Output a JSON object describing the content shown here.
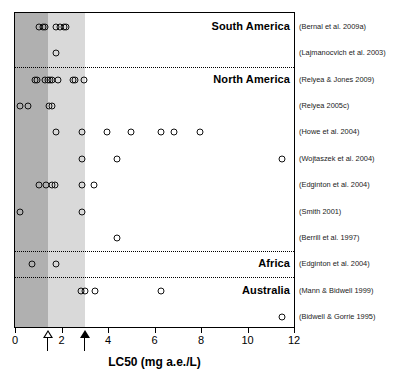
{
  "chart_data": {
    "type": "scatter",
    "title": "",
    "xlabel": "LC50 (mg a.e./L)",
    "ylabel": "",
    "xlim": [
      0,
      12
    ],
    "xticks": [
      0,
      2,
      4,
      6,
      8,
      10,
      12
    ],
    "xticklabels": [
      "0",
      "2",
      "4",
      "6",
      "8",
      "10",
      "12"
    ],
    "grid": false,
    "legend": null,
    "shaded_bands": [
      {
        "name": "dark-band",
        "from": 0,
        "to": 1.4,
        "color": "#b0b0b0"
      },
      {
        "name": "light-band",
        "from": 1.4,
        "to": 3.0,
        "color": "#d9d9d9"
      }
    ],
    "annotations": [
      {
        "name": "open-arrow",
        "x": 1.4,
        "style": "open-triangle"
      },
      {
        "name": "filled-arrow",
        "x": 3.0,
        "style": "filled-triangle"
      }
    ],
    "group_labels": [
      "South America",
      "North America",
      "Africa",
      "Australia"
    ],
    "series": [
      {
        "name": "(Bernal et al. 2009a)",
        "group": "South America",
        "values": [
          1.05,
          1.2,
          1.3,
          1.75,
          1.95,
          2.1,
          2.2
        ]
      },
      {
        "name": "(Lajmanocvich et al. 2003)",
        "group": "South America",
        "values": [
          1.75
        ]
      },
      {
        "name": "(Relyea & Jones 2009)",
        "group": "North America",
        "values": [
          0.85,
          0.95,
          1.3,
          1.4,
          1.5,
          1.6,
          1.85,
          2.5,
          2.6,
          2.95
        ]
      },
      {
        "name": "(Relyea 2005c)",
        "group": "North America",
        "values": [
          0.2,
          0.55,
          1.45,
          1.6
        ]
      },
      {
        "name": "(Howe et al. 2004)",
        "group": "North America",
        "values": [
          1.75,
          2.9,
          3.95,
          5.0,
          6.3,
          6.85,
          7.95
        ]
      },
      {
        "name": "(Wojtaszek et al. 2004)",
        "group": "North America",
        "values": [
          2.9,
          4.4,
          11.5
        ]
      },
      {
        "name": "(Edginton et al. 2004)",
        "group": "North America",
        "values": [
          1.05,
          1.35,
          1.6,
          1.7,
          2.9,
          3.4
        ]
      },
      {
        "name": "(Smith 2001)",
        "group": "North America",
        "values": [
          0.2,
          2.9
        ]
      },
      {
        "name": "(Berrill et al. 1997)",
        "group": "North America",
        "values": [
          4.4
        ]
      },
      {
        "name": "(Edginton et al. 2004)",
        "group": "Africa",
        "values": [
          0.75,
          1.75
        ]
      },
      {
        "name": "(Mann & Bidwell 1999)",
        "group": "Australia",
        "values": [
          2.85,
          3.0,
          3.45,
          6.3
        ]
      },
      {
        "name": "(Bidwell & Gorrie 1995)",
        "group": "Australia",
        "values": [
          11.5
        ]
      }
    ]
  }
}
